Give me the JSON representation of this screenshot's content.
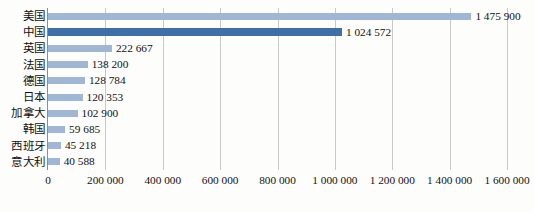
{
  "chart_data": {
    "type": "bar",
    "orientation": "horizontal",
    "title": "",
    "xlabel": "",
    "ylabel": "",
    "xlim": [
      0,
      1600000
    ],
    "xticks": [
      0,
      200000,
      400000,
      600000,
      800000,
      1000000,
      1200000,
      1400000,
      1600000
    ],
    "xtick_labels": [
      "0",
      "200 000",
      "400 000",
      "600 000",
      "800 000",
      "1 000 000",
      "1 200 000",
      "1 400 000",
      "1 600 000"
    ],
    "grid": true,
    "grid_axis": "x",
    "legend": "none",
    "categories": [
      "美国",
      "中国",
      "英国",
      "法国",
      "德国",
      "日本",
      "加拿大",
      "韩国",
      "西班牙",
      "意大利"
    ],
    "values": [
      1475900,
      1024572,
      222667,
      138200,
      128784,
      120353,
      102900,
      59685,
      45218,
      40588
    ],
    "value_labels": [
      "1 475 900",
      "1 024 572",
      "222 667",
      "138 200",
      "128 784",
      "120 353",
      "102 900",
      "59 685",
      "45 218",
      "40 588"
    ],
    "highlight_index": 1,
    "colors": {
      "bar": "#9fb6d4",
      "bar_highlight": "#3f6fa8",
      "gridline": "#c9c9c9",
      "axis": "#8d8d8d",
      "text": "#111111",
      "background": "#fdfdfc"
    }
  },
  "caption": ""
}
